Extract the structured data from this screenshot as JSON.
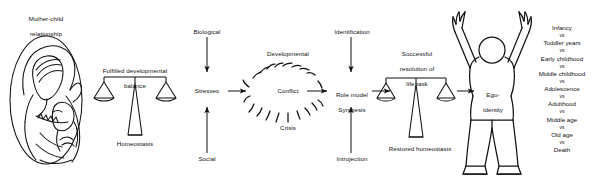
{
  "figure": {
    "type": "conceptual-flow-diagram",
    "background_color": "#ffffff",
    "line_color": "#111111"
  },
  "panels": {
    "mother_child": {
      "title_line1": "Mother-child",
      "title_line2": "relationship",
      "illustration_name": "mother-holding-child-line-drawing"
    },
    "first_balance": {
      "top_label_line1": "Fulfilled developmental",
      "top_label_line2": "balance",
      "bottom_label": "Homeostasis"
    },
    "stresses": {
      "top": "Biological",
      "center": "Stresses",
      "bottom": "Social"
    },
    "conflict": {
      "top": "Developmental",
      "center": "Conflict",
      "bottom": "Crisis"
    },
    "role_model": {
      "top": "Identification",
      "center_line1": "Role model",
      "center_line2": "Synthesis",
      "bottom": "Introjection"
    },
    "second_balance": {
      "top_label_line1": "Successful",
      "top_label_line2": "resolution of",
      "top_label_line3": "life task",
      "bottom_label": "Restored homeostasis"
    },
    "ego_figure": {
      "label_line1": "Ego-",
      "label_line2": "identity",
      "illustration_name": "standing-person-arms-raised"
    }
  },
  "stage_list": {
    "separator": "vs",
    "stages": [
      "Infancy",
      "Toddler years",
      "Early childhood",
      "Middle childhood",
      "Adolescence",
      "Adulthood",
      "Middle age",
      "Old age",
      "Death"
    ]
  }
}
